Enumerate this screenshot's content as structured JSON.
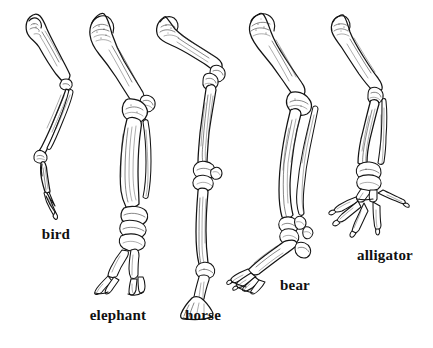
{
  "figure": {
    "background_color": "#ffffff",
    "ink_color": "#141414",
    "style": "pen-and-ink line engraving with cross-hatching",
    "width": 433,
    "height": 348
  },
  "specimens": [
    {
      "id": "bird",
      "label": "bird",
      "label_x": 56,
      "label_y": 227,
      "limb": "hind limb",
      "posture": "digitigrade",
      "bones": [
        "femur",
        "tibiotarsus",
        "fibula",
        "tarsometatarsus",
        "phalanges"
      ],
      "digit_count": 3
    },
    {
      "id": "elephant",
      "label": "elephant",
      "label_x": 118,
      "label_y": 308,
      "limb": "hind limb",
      "posture": "graviportal columnar",
      "bones": [
        "femur",
        "patella",
        "tibia",
        "fibula",
        "tarsals",
        "metatarsals",
        "phalanges"
      ],
      "digit_count": 4
    },
    {
      "id": "horse",
      "label": "horse",
      "label_x": 203,
      "label_y": 308,
      "limb": "hind limb",
      "posture": "unguligrade",
      "bones": [
        "femur",
        "tibia",
        "tarsals",
        "cannon bone",
        "pastern",
        "hoof"
      ],
      "digit_count": 1
    },
    {
      "id": "bear",
      "label": "bear",
      "label_x": 295,
      "label_y": 278,
      "limb": "hind limb",
      "posture": "plantigrade",
      "bones": [
        "femur",
        "tibia",
        "fibula",
        "tarsals",
        "metatarsals",
        "phalanges"
      ],
      "digit_count": 5
    },
    {
      "id": "alligator",
      "label": "alligator",
      "label_x": 385,
      "label_y": 248,
      "limb": "hind limb",
      "posture": "sprawling",
      "bones": [
        "femur",
        "tibia",
        "fibula",
        "tarsals",
        "metatarsals",
        "clawed phalanges"
      ],
      "digit_count": 5
    }
  ]
}
